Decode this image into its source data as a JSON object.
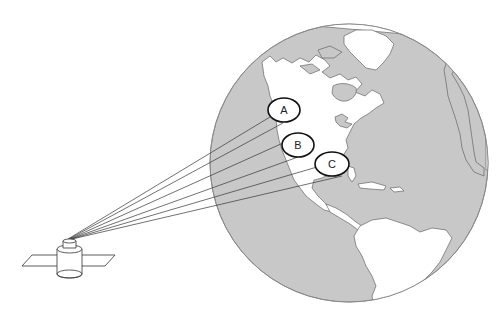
{
  "diagram": {
    "labels": [
      {
        "id": "A",
        "text": "A"
      },
      {
        "id": "B",
        "text": "B"
      },
      {
        "id": "C",
        "text": "C"
      }
    ],
    "signal_line_count": 6,
    "objects": {
      "globe": "Earth globe showing the Western Hemisphere (North America, Greenland, South America)",
      "satellite": "Communications satellite with solar panels"
    },
    "colors": {
      "ocean": "#c8c8c8",
      "land": "#ffffff",
      "outline": "#555555",
      "ink": "#222222"
    }
  }
}
